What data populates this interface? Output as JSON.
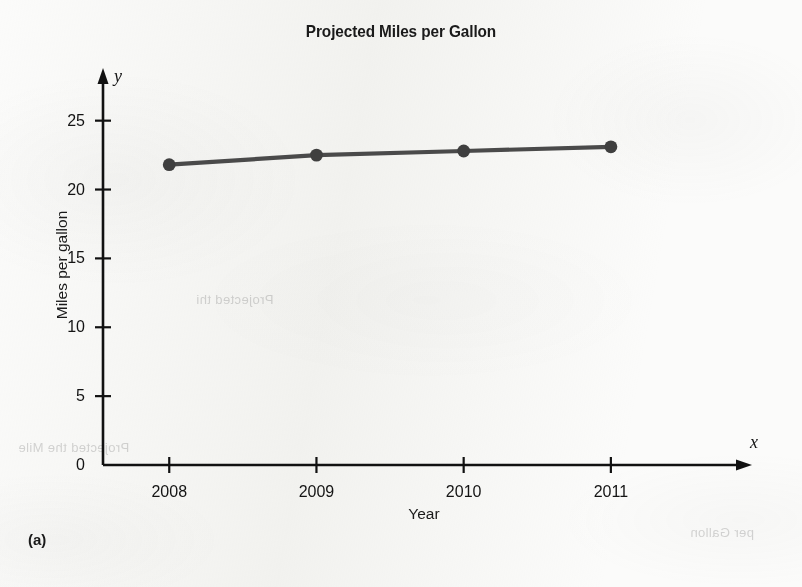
{
  "figure": {
    "panel_label": "(a)",
    "title": "Projected Miles per Gallon",
    "x_var_symbol": "x",
    "y_var_symbol": "y"
  },
  "chart_data": {
    "type": "line",
    "title": "Projected Miles per Gallon",
    "xlabel": "Year",
    "ylabel": "Miles per gallon",
    "categories": [
      "2008",
      "2009",
      "2010",
      "2011"
    ],
    "x": [
      2008,
      2009,
      2010,
      2011
    ],
    "values": [
      21.8,
      22.5,
      22.8,
      23.1
    ],
    "series": [
      {
        "name": "Projected miles per gallon",
        "values": [
          21.8,
          22.5,
          22.8,
          23.1
        ]
      }
    ],
    "xlim": [
      2007.55,
      2011.85
    ],
    "ylim": [
      0,
      26.5
    ],
    "ytick_labels": [
      "0",
      "5",
      "10",
      "15",
      "20",
      "25"
    ],
    "yticks": [
      0,
      5,
      10,
      15,
      20,
      25
    ],
    "xtick_labels": [
      "2008",
      "2009",
      "2010",
      "2011"
    ],
    "grid": false,
    "legend": false,
    "legend_position": "none",
    "marker": "circle",
    "line_color": "#4a4a4a",
    "marker_color": "#3f3f3f",
    "axis_color": "#111111",
    "axis_arrows": true,
    "annotations": []
  },
  "background_ghost_text": [
    {
      "text": "Projected the Mile",
      "x": 18,
      "y": 440
    },
    {
      "text": "Projected thi",
      "x": 196,
      "y": 292
    },
    {
      "text": "per Gallon",
      "x": 690,
      "y": 525
    }
  ]
}
